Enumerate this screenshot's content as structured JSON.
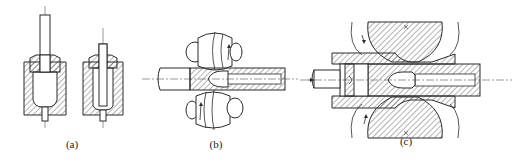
{
  "figures": [
    {
      "id": "a",
      "label": "(a)",
      "description": "Two vertical punch-in-die piercing stages: a punch pressing into a hatched container die holding a billet, and a second stage with a narrower mandrel inside the cup"
    },
    {
      "id": "b",
      "label": "(b)",
      "description": "Two barrel-shaped rolls above and below a horizontal bar being pierced over a bullet-shaped mandrel, with rotation arrows on each roll"
    },
    {
      "id": "c",
      "label": "(c)",
      "description": "Section view of two large hatched rolls with a horizontal pusher feeding a billet (arrow from left) through a guide sleeve over a conical piercing plug"
    }
  ],
  "colors": {
    "line": "#2a2a2a",
    "hatch": "#444444",
    "background": "#ffffff"
  }
}
